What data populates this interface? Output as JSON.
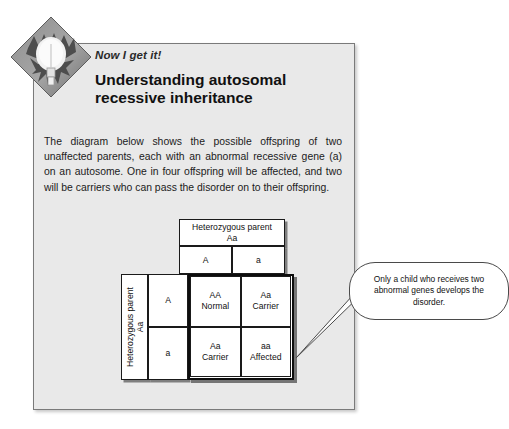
{
  "page": {
    "background_color": "#ffffff",
    "panel_color": "#e9e9e9",
    "panel_border_color": "#7a7a7a"
  },
  "icon": {
    "name": "lightbulb-diamond-icon",
    "description": "gray diamond with lightbulb and splash burst"
  },
  "header": {
    "kicker": "Now I get it!",
    "headline": "Understanding autosomal recessive inheritance"
  },
  "body": {
    "paragraph": "The diagram below shows the possible offspring of two unaffected parents, each with an abnormal recessive gene (a) on an autosome. One in four offspring will be affected, and two will be carriers who can pass the disorder on to their offspring."
  },
  "punnett": {
    "top_parent_label": "Heterozygous parent\nAa",
    "top_parent_line1": "Heterozygous parent",
    "top_parent_line2": "Aa",
    "left_parent_line1": "Heterozygous parent",
    "left_parent_line2": "Aa",
    "top_alleles": [
      "A",
      "a"
    ],
    "left_alleles": [
      "A",
      "a"
    ],
    "cells": [
      {
        "genotype": "AA",
        "phenotype": "Normal"
      },
      {
        "genotype": "Aa",
        "phenotype": "Carrier"
      },
      {
        "genotype": "Aa",
        "phenotype": "Carrier"
      },
      {
        "genotype": "aa",
        "phenotype": "Affected"
      }
    ]
  },
  "callout": {
    "text": "Only a child who receives two abnormal genes develops the disorder."
  }
}
